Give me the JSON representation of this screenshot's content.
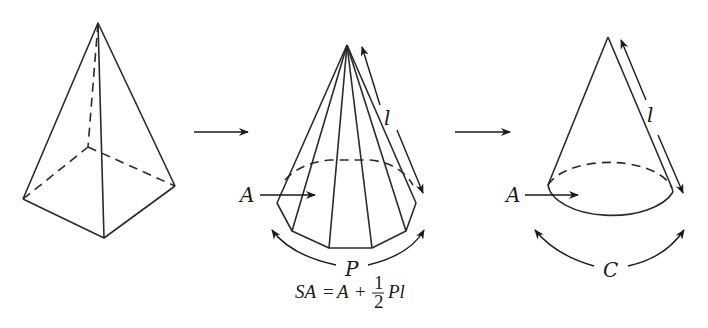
{
  "diagram": {
    "colors": {
      "stroke": "#2a2a2a",
      "background": "#ffffff"
    },
    "figures": [
      {
        "id": "square-pyramid",
        "label": ""
      },
      {
        "id": "polygonal-pyramid",
        "labels": {
          "base_area": "A",
          "slant_height": "l",
          "perimeter": "P"
        }
      },
      {
        "id": "cone",
        "labels": {
          "base_area": "A",
          "slant_height": "l",
          "circumference": "C"
        }
      }
    ],
    "labels": {
      "pyr_A": "A",
      "pyr_l": "l",
      "pyr_P": "P",
      "cone_A": "A",
      "cone_l": "l",
      "cone_C": "C"
    },
    "formula": {
      "lhs": "SA",
      "eq": "=",
      "a": "A",
      "plus": "+",
      "num": "1",
      "den": "2",
      "rest": "Pl"
    },
    "arrows": [
      "transition-arrow-1",
      "transition-arrow-2"
    ]
  }
}
